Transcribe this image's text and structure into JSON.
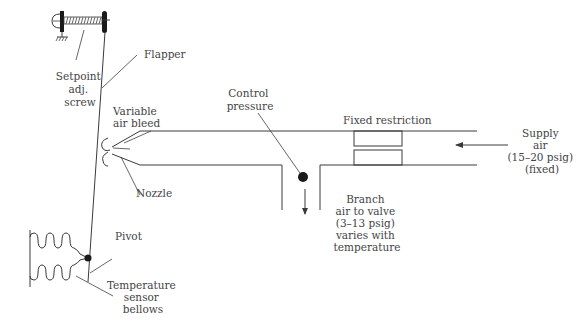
{
  "diagram": {
    "type": "pneumatic-thermostat-schematic",
    "labels": {
      "flapper": "Flapper",
      "setpoint": [
        "Setpoint",
        "adj.",
        "screw"
      ],
      "variable_air_bleed": [
        "Variable",
        "air bleed"
      ],
      "nozzle": "Nozzle",
      "control_pressure": [
        "Control",
        "pressure"
      ],
      "fixed_restriction": "Fixed restriction",
      "supply_air": [
        "Supply",
        "air",
        "(15–20 psig)",
        "(fixed)"
      ],
      "branch_air": [
        "Branch",
        "air to valve",
        "(3–13 psig)",
        "varies with",
        "temperature"
      ],
      "pivot": "Pivot",
      "temperature_bellows": [
        "Temperature",
        "sensor",
        "bellows"
      ]
    },
    "colors": {
      "line": "#3a3a3a",
      "text": "#444444",
      "fill_dark": "#1a1a1a"
    }
  }
}
